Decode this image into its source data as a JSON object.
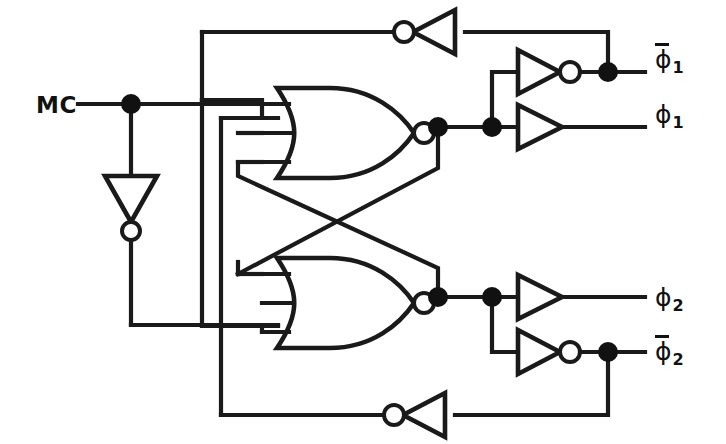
{
  "diagram": {
    "type": "logic-schematic",
    "stroke_color": "#1a1a1a",
    "fill_color": "#ffffff",
    "inputs": [
      {
        "id": "mc",
        "label": "MC",
        "x": 40,
        "y": 104
      }
    ],
    "outputs": [
      {
        "id": "phi1-bar",
        "glyph": "ϕ",
        "subscript": "1",
        "overline": true,
        "x": 660,
        "y": 60
      },
      {
        "id": "phi1",
        "glyph": "ϕ",
        "subscript": "1",
        "overline": false,
        "x": 660,
        "y": 114
      },
      {
        "id": "phi2",
        "glyph": "ϕ",
        "subscript": "2",
        "overline": false,
        "x": 660,
        "y": 297
      },
      {
        "id": "phi2-bar",
        "glyph": "ϕ",
        "subscript": "2",
        "overline": true,
        "x": 660,
        "y": 352
      }
    ],
    "gates": [
      {
        "id": "nor-upper",
        "kind": "nor",
        "inputs": 3,
        "x": 275,
        "y": 88,
        "w": 120,
        "h": 90
      },
      {
        "id": "nor-lower",
        "kind": "nor",
        "inputs": 3,
        "x": 275,
        "y": 258,
        "w": 120,
        "h": 90
      },
      {
        "id": "inv-mc",
        "kind": "inverter",
        "orientation": "down",
        "x": 110,
        "y": 175
      },
      {
        "id": "inv-fb-top",
        "kind": "inverter",
        "orientation": "left",
        "x": 405,
        "y": 30
      },
      {
        "id": "inv-fb-bot",
        "kind": "inverter",
        "orientation": "left",
        "x": 395,
        "y": 410
      },
      {
        "id": "inv-phi1bar",
        "kind": "inverter",
        "orientation": "right",
        "x": 518,
        "y": 72
      },
      {
        "id": "buf-phi1",
        "kind": "buffer",
        "orientation": "right",
        "x": 518,
        "y": 127
      },
      {
        "id": "buf-phi2",
        "kind": "buffer",
        "orientation": "right",
        "x": 518,
        "y": 297
      },
      {
        "id": "inv-phi2bar",
        "kind": "inverter",
        "orientation": "right",
        "x": 518,
        "y": 352
      }
    ],
    "junctions": [
      {
        "id": "j-mc",
        "x": 131,
        "y": 104
      },
      {
        "id": "j-phi1-a",
        "x": 438,
        "y": 127
      },
      {
        "id": "j-phi1-b",
        "x": 492,
        "y": 127
      },
      {
        "id": "j-phi1bar",
        "x": 608,
        "y": 72
      },
      {
        "id": "j-phi2-a",
        "x": 438,
        "y": 297
      },
      {
        "id": "j-phi2-b",
        "x": 492,
        "y": 297
      },
      {
        "id": "j-phi2bar",
        "x": 608,
        "y": 352
      }
    ],
    "notes": {
      "cross_coupling": "Upper NOR output feeds lower NOR input and vice-versa via crossed diagonal wires",
      "feedback_top": "phi1-bar node routes left through inverter back to upper NOR input bus",
      "feedback_bottom": "phi2-bar node routes left through inverter back to lower NOR input bus"
    }
  }
}
